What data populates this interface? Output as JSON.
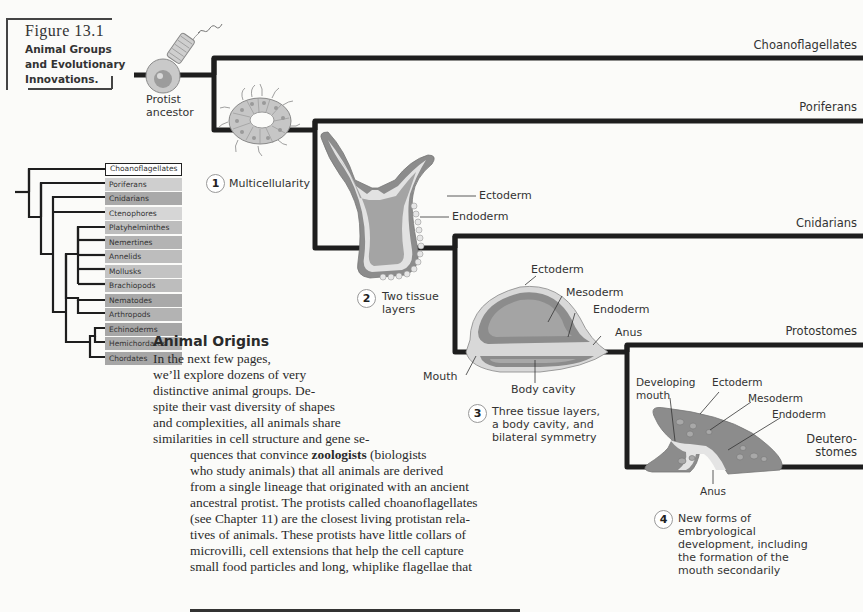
{
  "figure": {
    "number": "Figure 13.1",
    "caption_lines": [
      "Animal Groups",
      "and Evolutionary",
      "Innovations."
    ]
  },
  "ancestor_label": [
    "Protist",
    "ancestor"
  ],
  "branches": [
    {
      "name": "Choanoflagellates"
    },
    {
      "name": "Poriferans"
    },
    {
      "name": "Cnidarians"
    },
    {
      "name": "Protostomes"
    },
    {
      "name": "Deutero-",
      "name2": "stomes"
    }
  ],
  "innovations": [
    {
      "number": "1",
      "lines": [
        "Multicellularity"
      ]
    },
    {
      "number": "2",
      "lines": [
        "Two tissue",
        "layers"
      ]
    },
    {
      "number": "3",
      "lines": [
        "Three tissue layers,",
        "a body cavity, and",
        "bilateral symmetry"
      ]
    },
    {
      "number": "4",
      "lines": [
        "New forms of",
        "embryological",
        "development, including",
        "the formation of the",
        "mouth secondarily"
      ]
    }
  ],
  "cnidarian_labels": {
    "ectoderm": "Ectoderm",
    "endoderm": "Endoderm"
  },
  "protostome_labels": {
    "ectoderm": "Ectoderm",
    "mesoderm": "Mesoderm",
    "endoderm": "Endoderm",
    "anus": "Anus",
    "mouth": "Mouth",
    "body_cavity": "Body cavity"
  },
  "deuterostome_labels": {
    "developing_mouth": [
      "Developing",
      "mouth"
    ],
    "ectoderm": "Ectoderm",
    "mesoderm": "Mesoderm",
    "endoderm": "Endoderm",
    "anus": "Anus"
  },
  "mini_cladogram": {
    "taxa": [
      {
        "name": "Choanoflagellates",
        "color": "#ffffff"
      },
      {
        "name": "Poriferans",
        "color": "#cfcfcf"
      },
      {
        "name": "Cnidarians",
        "color": "#a9a9a9"
      },
      {
        "name": "Ctenophores",
        "color": "#d6d6d6"
      },
      {
        "name": "Platyhelminthes",
        "color": "#bdbdbd"
      },
      {
        "name": "Nemertines",
        "color": "#b3b3b3"
      },
      {
        "name": "Annelids",
        "color": "#bdbdbd"
      },
      {
        "name": "Mollusks",
        "color": "#c3c3c3"
      },
      {
        "name": "Brachiopods",
        "color": "#bdbdbd"
      },
      {
        "name": "Nematodes",
        "color": "#a9a9a9"
      },
      {
        "name": "Arthropods",
        "color": "#b3b3b3"
      },
      {
        "name": "Echinoderms",
        "color": "#a6a6a6"
      },
      {
        "name": "Hemichordates",
        "color": "#adadad"
      },
      {
        "name": "Chordates",
        "color": "#a6a6a6"
      }
    ]
  },
  "section": {
    "heading": "Animal Origins",
    "lines": [
      "In  the  next  few  pages,",
      "we’ll explore dozens of very",
      "distinctive animal groups. De-",
      "spite their vast diversity of shapes",
      "and  complexities,  all  animals  share",
      "similarities in cell structure and gene se-",
      "quences that convince ",
      "who study animals) that all animals are derived",
      "from a single lineage that originated with an ancient",
      "ancestral protist. The protists called choanoflagellates",
      "(see Chapter 11) are the closest living protistan rela-",
      "tives of animals. These protists have little collars of",
      "microvilli, cell extensions that help the cell capture",
      "small food particles and long, whiplike flagellae that"
    ],
    "bold_term": "zoologists",
    "after_bold": " (biologists"
  },
  "colors": {
    "tree_line": "#1e1e1e",
    "tissue_dark": "#8c8c8c",
    "tissue_mid": "#a8a8a8",
    "tissue_light": "#dcdcdc",
    "background": "#fbfbf9"
  }
}
